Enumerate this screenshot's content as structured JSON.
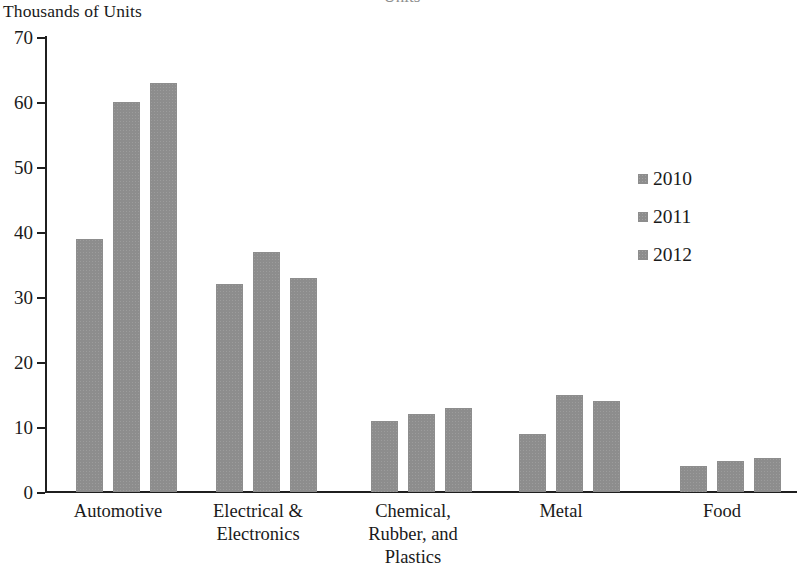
{
  "header": {
    "cut_off_title": "Units"
  },
  "axis": {
    "y_caption": "Thousands of Units",
    "y_ticks": [
      "0",
      "10",
      "20",
      "30",
      "40",
      "50",
      "60",
      "70"
    ]
  },
  "legend": {
    "position": "right",
    "entries": [
      {
        "label": "2010",
        "color": "#8d8d8d"
      },
      {
        "label": "2011",
        "color": "#8d8d8d"
      },
      {
        "label": "2012",
        "color": "#8d8d8d"
      }
    ]
  },
  "colors": {
    "bar": "#8d8d8d",
    "axis": "#1f1f1f",
    "text": "#1a1a1a",
    "background": "#ffffff"
  },
  "chart_data": {
    "type": "bar",
    "title": "",
    "xlabel": "",
    "ylabel": "Thousands of Units",
    "ylim": [
      0,
      70
    ],
    "ytick_step": 10,
    "grid": false,
    "legend_position": "right",
    "categories": [
      "Automotive",
      "Electrical &\nElectronics",
      "Chemical,\nRubber, and\nPlastics",
      "Metal",
      "Food"
    ],
    "series": [
      {
        "name": "2010",
        "values": [
          39,
          32,
          11,
          9,
          4
        ]
      },
      {
        "name": "2011",
        "values": [
          60,
          37,
          12,
          15,
          4.7
        ]
      },
      {
        "name": "2012",
        "values": [
          63,
          33,
          13,
          14,
          5.2
        ]
      }
    ]
  }
}
